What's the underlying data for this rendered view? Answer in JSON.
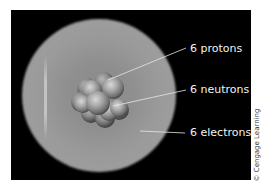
{
  "figure": {
    "background_color": "#000000",
    "labels": [
      {
        "id": "protons",
        "text": "6 protons"
      },
      {
        "id": "neutrons",
        "text": "6 neutrons"
      },
      {
        "id": "electrons",
        "text": "6 electrons"
      }
    ],
    "credit": "© Cengage Learning"
  }
}
